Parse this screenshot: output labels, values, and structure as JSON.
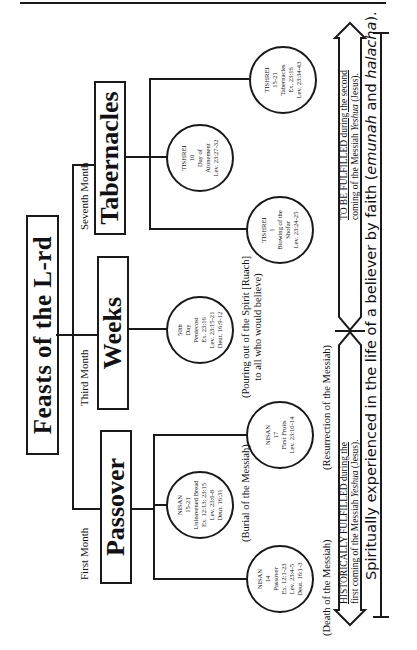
{
  "title": "Feasts of the L-rd",
  "feasts": [
    {
      "name": "Passover",
      "month": "First Month"
    },
    {
      "name": "Weeks",
      "month": "Third Month"
    },
    {
      "name": "Tabernacles",
      "month": "Seventh Month"
    }
  ],
  "circles": [
    {
      "lines": [
        "NISAN",
        "14",
        "Passover",
        "Ex. 12:1-23",
        "Lev. 23:4-5",
        "Deut. 16:1-3"
      ]
    },
    {
      "lines": [
        "NISAN",
        "15-21",
        "Unleavened Bread",
        "Ex. 12:13; 23:15",
        "Lev. 23:6-8",
        "Deut. 16:31"
      ]
    },
    {
      "lines": [
        "NISAN",
        "17",
        "First Fruits",
        "Lev. 23:10-14"
      ]
    },
    {
      "lines": [
        "50th",
        "Day",
        "Pentecost",
        "Ex. 23:16",
        "Lev. 23:15-21",
        "Deut. 16:9-12"
      ]
    },
    {
      "lines": [
        "TISHREI",
        "1",
        "Blowing of the",
        "Shofar",
        "Lev. 23:24-25"
      ]
    },
    {
      "lines": [
        "TISHREI",
        "10",
        "Day of",
        "Atonement",
        "Lev. 23:27-32"
      ]
    },
    {
      "lines": [
        "TISHREI",
        "15-21",
        "Tabernacles",
        "Ex. 23:16",
        "Lev. 23:34-43"
      ]
    }
  ],
  "notes": {
    "death": "(Death of the Messiah)",
    "burial": "(Burial of the Messiah)",
    "resurrection": "(Resurrection of the Messiah)",
    "pouring_line1": "(Pouring out of the Spirit [Ruach]",
    "pouring_line2": "to all who would believe)"
  },
  "arrow": {
    "past_line1": "HISTORICALLY FULFILLED during the",
    "past_line2_a": "first coming of the Messiah ",
    "past_line2_b": "Yeshua",
    "past_line2_c": " (Jesus).",
    "future_line1": "TO BE FULFILLED during the  second",
    "future_line2_a": "coming of the Messiah ",
    "future_line2_b": "Yeshua",
    "future_line2_c": " (Jesus)."
  },
  "bottom": {
    "text_a": "Spiritually experienced in the life of a believer by faith (",
    "text_b": "emunah",
    "text_c": " and ",
    "text_d": "halacha",
    "text_e": ")."
  }
}
